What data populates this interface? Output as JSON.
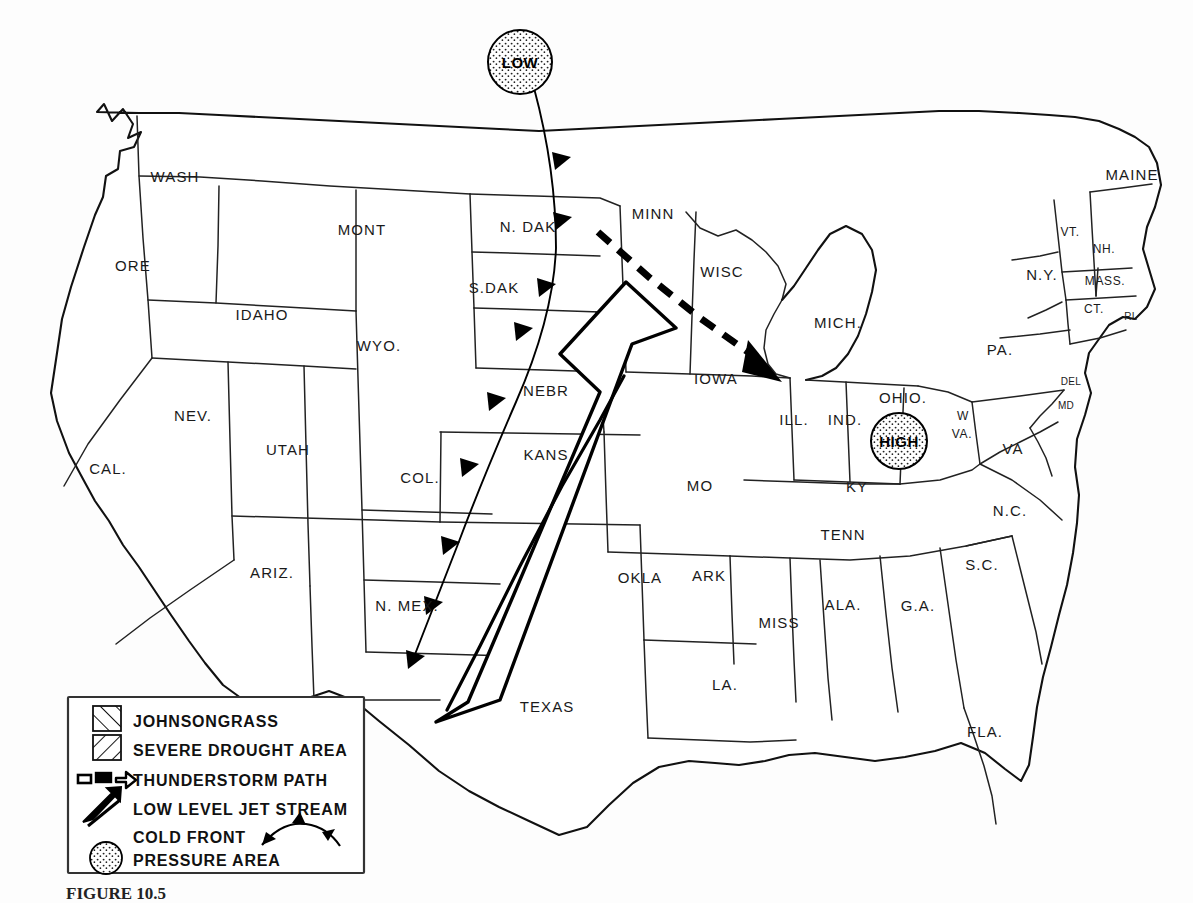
{
  "figure": {
    "caption_prefix": "FIGURE 10.5",
    "caption": "FIGURE 10.5"
  },
  "pressure_systems": [
    {
      "name": "low-pressure",
      "label": "LOW",
      "x": 520,
      "y": 62
    },
    {
      "name": "high-pressure",
      "label": "HIGH",
      "x": 899,
      "y": 441
    }
  ],
  "legend": {
    "items": [
      {
        "key": "johnsongrass",
        "label": "JOHNSONGRASS",
        "symbol": "hatch-swatch-right"
      },
      {
        "key": "severe-drought",
        "label": "SEVERE DROUGHT AREA",
        "symbol": "hatch-swatch-left"
      },
      {
        "key": "thunderstorm-path",
        "label": "THUNDERSTORM PATH",
        "symbol": "dashed-arrow"
      },
      {
        "key": "low-level-jet",
        "label": "LOW LEVEL JET STREAM",
        "symbol": "jet-arrow"
      },
      {
        "key": "cold-front",
        "label": "COLD FRONT",
        "symbol": "cold-front-barbs"
      },
      {
        "key": "pressure-area",
        "label": "PRESSURE AREA",
        "symbol": "stippled-circle"
      }
    ]
  },
  "states": [
    {
      "abbr": "WASH",
      "x": 175,
      "y": 182,
      "size": "md"
    },
    {
      "abbr": "ORE",
      "x": 133,
      "y": 271,
      "size": "md"
    },
    {
      "abbr": "IDAHO",
      "x": 262,
      "y": 320,
      "size": "md"
    },
    {
      "abbr": "MONT",
      "x": 362,
      "y": 235,
      "size": "md"
    },
    {
      "abbr": "WYO.",
      "x": 379,
      "y": 351,
      "size": "md"
    },
    {
      "abbr": "NEV.",
      "x": 193,
      "y": 421,
      "size": "md"
    },
    {
      "abbr": "CAL.",
      "x": 108,
      "y": 474,
      "size": "md"
    },
    {
      "abbr": "UTAH",
      "x": 288,
      "y": 455,
      "size": "md"
    },
    {
      "abbr": "COL.",
      "x": 420,
      "y": 483,
      "size": "md"
    },
    {
      "abbr": "ARIZ.",
      "x": 272,
      "y": 578,
      "size": "md"
    },
    {
      "abbr": "N. MEX.",
      "x": 407,
      "y": 611,
      "size": "md"
    },
    {
      "abbr": "N. DAK",
      "x": 528,
      "y": 232,
      "size": "md"
    },
    {
      "abbr": "S.DAK",
      "x": 494,
      "y": 293,
      "size": "md"
    },
    {
      "abbr": "NEBR",
      "x": 546,
      "y": 396,
      "size": "md"
    },
    {
      "abbr": "KANS",
      "x": 546,
      "y": 460,
      "size": "md"
    },
    {
      "abbr": "OKLA",
      "x": 640,
      "y": 583,
      "size": "md"
    },
    {
      "abbr": "TEXAS",
      "x": 547,
      "y": 712,
      "size": "md"
    },
    {
      "abbr": "MINN",
      "x": 653,
      "y": 219,
      "size": "md"
    },
    {
      "abbr": "IOWA",
      "x": 716,
      "y": 384,
      "size": "md"
    },
    {
      "abbr": "MO",
      "x": 700,
      "y": 491,
      "size": "md"
    },
    {
      "abbr": "ARK",
      "x": 709,
      "y": 581,
      "size": "md"
    },
    {
      "abbr": "LA.",
      "x": 725,
      "y": 690,
      "size": "md"
    },
    {
      "abbr": "WISC",
      "x": 722,
      "y": 277,
      "size": "md"
    },
    {
      "abbr": "ILL.",
      "x": 794,
      "y": 425,
      "size": "md"
    },
    {
      "abbr": "IND.",
      "x": 845,
      "y": 425,
      "size": "md"
    },
    {
      "abbr": "MICH.",
      "x": 838,
      "y": 328,
      "size": "md"
    },
    {
      "abbr": "OHIO.",
      "x": 903,
      "y": 403,
      "size": "md"
    },
    {
      "abbr": "KY",
      "x": 857,
      "y": 492,
      "size": "md"
    },
    {
      "abbr": "TENN",
      "x": 843,
      "y": 540,
      "size": "md"
    },
    {
      "abbr": "MISS",
      "x": 779,
      "y": 628,
      "size": "md"
    },
    {
      "abbr": "ALA.",
      "x": 843,
      "y": 610,
      "size": "md"
    },
    {
      "abbr": "G.A.",
      "x": 918,
      "y": 611,
      "size": "md"
    },
    {
      "abbr": "S.C.",
      "x": 982,
      "y": 570,
      "size": "md"
    },
    {
      "abbr": "N.C.",
      "x": 1010,
      "y": 516,
      "size": "md"
    },
    {
      "abbr": "FLA.",
      "x": 985,
      "y": 737,
      "size": "md"
    },
    {
      "abbr": "VA",
      "x": 1013,
      "y": 454,
      "size": "md"
    },
    {
      "abbr": "W",
      "x": 963,
      "y": 420,
      "size": "sm"
    },
    {
      "abbr": "VA.",
      "x": 962,
      "y": 438,
      "size": "sm"
    },
    {
      "abbr": "PA.",
      "x": 1000,
      "y": 355,
      "size": "md"
    },
    {
      "abbr": "N.Y.",
      "x": 1042,
      "y": 280,
      "size": "md"
    },
    {
      "abbr": "MAINE",
      "x": 1132,
      "y": 180,
      "size": "md"
    },
    {
      "abbr": "VT.",
      "x": 1070,
      "y": 236,
      "size": "sm"
    },
    {
      "abbr": "NH.",
      "x": 1104,
      "y": 253,
      "size": "sm"
    },
    {
      "abbr": "MASS.",
      "x": 1105,
      "y": 285,
      "size": "sm"
    },
    {
      "abbr": "CT.",
      "x": 1094,
      "y": 313,
      "size": "sm"
    },
    {
      "abbr": "RI.",
      "x": 1131,
      "y": 320,
      "size": "xs"
    },
    {
      "abbr": "DEL",
      "x": 1071,
      "y": 385,
      "size": "xs"
    },
    {
      "abbr": "MD",
      "x": 1066,
      "y": 409,
      "size": "xs"
    }
  ],
  "colors": {
    "ink": "#111111",
    "paper": "#fdfdfd",
    "hatch": "#1a1a1a"
  }
}
